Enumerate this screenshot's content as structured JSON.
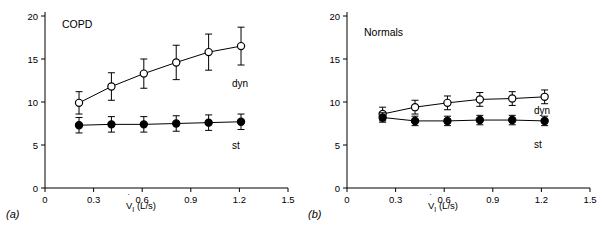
{
  "figure": {
    "panels": [
      {
        "tag": "(a)",
        "title": "COPD",
        "xlabel": "V̇I (L/s)",
        "ylabel": "EL (cmH2O/L)",
        "xticks": [
          "0",
          "0.3",
          "0.6",
          "0.9",
          "1.2",
          "1.5"
        ],
        "yticks": [
          "0",
          "5",
          "10",
          "15",
          "20"
        ],
        "series_labels": {
          "dyn": "dyn",
          "st": "st"
        }
      },
      {
        "tag": "(b)",
        "title": "Normals",
        "xlabel": "V̇I (L/s)",
        "ylabel": "EL (cmH2O/L)",
        "xticks": [
          "0",
          "0.3",
          "0.6",
          "0.9",
          "1.2",
          "1.5"
        ],
        "yticks": [
          "0",
          "5",
          "10",
          "15",
          "20"
        ],
        "series_labels": {
          "dyn": "dyn",
          "st": "st"
        }
      }
    ]
  },
  "chart_data": [
    {
      "type": "line",
      "title": "COPD",
      "xlabel": "V̇I (L/s)",
      "ylabel": "EL (cmH2O/L)",
      "xlim": [
        0,
        1.5
      ],
      "ylim": [
        0,
        20
      ],
      "xticks": [
        0,
        0.3,
        0.6,
        0.9,
        1.2,
        1.5
      ],
      "yticks": [
        0,
        5,
        10,
        15,
        20
      ],
      "grid": false,
      "legend": "inline-annotation",
      "x": [
        0.21,
        0.41,
        0.61,
        0.81,
        1.01,
        1.21
      ],
      "series": [
        {
          "name": "dyn",
          "marker": "open-circle",
          "values": [
            9.9,
            11.8,
            13.3,
            14.6,
            15.8,
            16.5
          ],
          "err_upper": [
            1.3,
            1.6,
            1.7,
            2.0,
            2.1,
            2.2
          ],
          "err_lower": [
            1.3,
            1.6,
            1.7,
            2.0,
            2.1,
            2.2
          ]
        },
        {
          "name": "st",
          "marker": "filled-circle",
          "values": [
            7.3,
            7.4,
            7.4,
            7.5,
            7.6,
            7.7
          ],
          "err_upper": [
            0.9,
            0.9,
            0.9,
            0.9,
            0.9,
            0.9
          ],
          "err_lower": [
            0.9,
            0.9,
            0.9,
            0.9,
            0.9,
            0.9
          ]
        }
      ]
    },
    {
      "type": "line",
      "title": "Normals",
      "xlabel": "V̇I (L/s)",
      "ylabel": "EL (cmH2O/L)",
      "xlim": [
        0,
        1.5
      ],
      "ylim": [
        0,
        20
      ],
      "xticks": [
        0,
        0.3,
        0.6,
        0.9,
        1.2,
        1.5
      ],
      "yticks": [
        0,
        5,
        10,
        15,
        20
      ],
      "grid": false,
      "legend": "inline-annotation",
      "x": [
        0.22,
        0.42,
        0.62,
        0.82,
        1.02,
        1.22
      ],
      "series": [
        {
          "name": "dyn",
          "marker": "open-circle",
          "values": [
            8.6,
            9.4,
            9.9,
            10.3,
            10.4,
            10.6
          ],
          "err_upper": [
            0.8,
            0.8,
            0.8,
            0.8,
            0.8,
            0.8
          ],
          "err_lower": [
            0.8,
            0.8,
            0.8,
            0.8,
            0.8,
            0.8
          ]
        },
        {
          "name": "st",
          "marker": "filled-circle",
          "values": [
            8.2,
            7.8,
            7.8,
            7.9,
            7.9,
            7.8
          ],
          "err_upper": [
            0.55,
            0.55,
            0.55,
            0.55,
            0.55,
            0.55
          ],
          "err_lower": [
            0.55,
            0.55,
            0.55,
            0.55,
            0.55,
            0.55
          ]
        }
      ]
    }
  ]
}
